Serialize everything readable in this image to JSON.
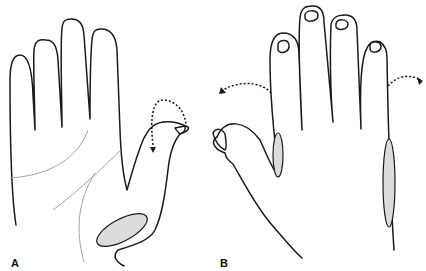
{
  "figure": {
    "panels": [
      {
        "label": "A",
        "description": "Palmar view of hand with thumb flexed; shaded ellipse at thenar/wrist area; dotted curved arrow indicating thumb flexion"
      },
      {
        "label": "B",
        "description": "Dorsal view of hand with fingers; shaded ellipses along radial side of index finger and ulnar border of hand; dotted curved arrows indicating abduction"
      }
    ],
    "colors": {
      "outline": "#1a1a1a",
      "shading": "#dcdcdc",
      "crease": "#9a9a9a",
      "background": "#ffffff"
    }
  }
}
